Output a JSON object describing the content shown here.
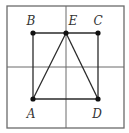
{
  "figure": {
    "width": 129,
    "height": 133,
    "frame": {
      "x1": 7,
      "y1": 6,
      "x2": 124,
      "y2": 128
    },
    "grid": {
      "vertical_x": 66,
      "horizontal_y": 67
    },
    "points": {
      "A": {
        "x": 33,
        "y": 99,
        "label": "A",
        "label_x": 31,
        "label_y": 118
      },
      "B": {
        "x": 33,
        "y": 33,
        "label": "B",
        "label_x": 31,
        "label_y": 25
      },
      "C": {
        "x": 98,
        "y": 33,
        "label": "C",
        "label_x": 98,
        "label_y": 25
      },
      "D": {
        "x": 98,
        "y": 99,
        "label": "D",
        "label_x": 97,
        "label_y": 118
      },
      "E": {
        "x": 66,
        "y": 33,
        "label": "E",
        "label_x": 73,
        "label_y": 25
      }
    },
    "segments": [
      [
        "A",
        "B"
      ],
      [
        "B",
        "C"
      ],
      [
        "C",
        "D"
      ],
      [
        "D",
        "A"
      ],
      [
        "A",
        "E"
      ],
      [
        "E",
        "D"
      ]
    ],
    "colors": {
      "grid": "#6b6b6b",
      "edge": "#2a2a2a",
      "point": "#111111",
      "label": "#333333"
    }
  }
}
